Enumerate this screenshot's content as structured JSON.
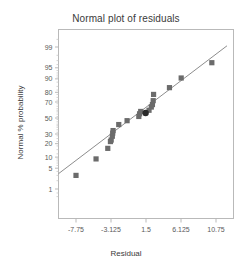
{
  "chart_data": {
    "type": "scatter",
    "title": "Normal plot of residuals",
    "xlabel": "Residual",
    "ylabel": "Normal % probability",
    "xlim": [
      -10.0625,
      13.0625
    ],
    "xticks": [
      "-7.75",
      "-3.125",
      "1.5",
      "6.125",
      "10.75"
    ],
    "xtick_values": [
      -7.75,
      -3.125,
      1.5,
      6.125,
      10.75
    ],
    "yticks": [
      "1",
      "5",
      "10",
      "20",
      "30",
      "50",
      "70",
      "80",
      "90",
      "95",
      "99"
    ],
    "ytick_values": [
      1,
      5,
      10,
      20,
      30,
      50,
      70,
      80,
      90,
      95,
      99
    ],
    "y_scale": "normal-probability",
    "ylim": [
      0.4,
      99.7
    ],
    "grid": false,
    "legend": null,
    "series": [
      {
        "name": "Residuals",
        "marker": "square",
        "color": "#6b6b6b",
        "points": [
          {
            "x": -7.75,
            "y": 3.0
          },
          {
            "x": -5.1,
            "y": 9.0
          },
          {
            "x": -3.55,
            "y": 16.0
          },
          {
            "x": -3.2,
            "y": 22.0
          },
          {
            "x": -3.1,
            "y": 23.5
          },
          {
            "x": -2.95,
            "y": 27.5
          },
          {
            "x": -2.9,
            "y": 31.0
          },
          {
            "x": -2.85,
            "y": 34.0
          },
          {
            "x": -2.1,
            "y": 41.5
          },
          {
            "x": -1.0,
            "y": 46.5
          },
          {
            "x": 0.55,
            "y": 52.0
          },
          {
            "x": 0.65,
            "y": 55.5
          },
          {
            "x": 0.8,
            "y": 58.5
          },
          {
            "x": 1.9,
            "y": 60.0
          },
          {
            "x": 2.2,
            "y": 64.0
          },
          {
            "x": 2.35,
            "y": 67.0
          },
          {
            "x": 2.45,
            "y": 71.5
          },
          {
            "x": 2.5,
            "y": 78.0
          },
          {
            "x": 4.6,
            "y": 84.0
          },
          {
            "x": 6.15,
            "y": 90.5
          },
          {
            "x": 10.2,
            "y": 96.5
          }
        ]
      },
      {
        "name": "Highlighted residual",
        "marker": "circle",
        "color": "#2a2a2a",
        "points": [
          {
            "x": 1.45,
            "y": 56.5
          }
        ]
      }
    ],
    "reference_line": {
      "name": "Normal reference line",
      "color": "#8d8d8d",
      "x1": -10.0625,
      "y1": 3.4,
      "x2": 12.2,
      "y2": 99.1
    }
  },
  "colors": {
    "axis": "#b9b9b9",
    "text": "#3a3a3a",
    "tick_text": "#5a5a5a",
    "marker": "#6b6b6b",
    "highlight_marker": "#2a2a2a",
    "line": "#8d8d8d",
    "background": "#ffffff"
  }
}
